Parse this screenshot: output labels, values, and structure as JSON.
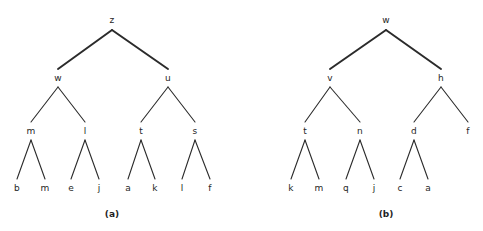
{
  "figure": {
    "background_color": "#ffffff",
    "edge_color": "#2b2b2b",
    "text_color": "#262626",
    "panels": [
      {
        "id": "a",
        "caption": "(a)",
        "caption_x": 112,
        "caption_y": 214,
        "nodes": [
          {
            "label": "z",
            "x": 112,
            "y": 20,
            "level": 0
          },
          {
            "label": "w",
            "x": 58,
            "y": 78,
            "level": 1
          },
          {
            "label": "u",
            "x": 168,
            "y": 78,
            "level": 1
          },
          {
            "label": "m",
            "x": 31,
            "y": 131,
            "level": 2
          },
          {
            "label": "l",
            "x": 85,
            "y": 131,
            "level": 2
          },
          {
            "label": "t",
            "x": 141,
            "y": 131,
            "level": 2
          },
          {
            "label": "s",
            "x": 195,
            "y": 131,
            "level": 2
          },
          {
            "label": "b",
            "x": 17,
            "y": 188,
            "level": 3
          },
          {
            "label": "m",
            "x": 45,
            "y": 188,
            "level": 3
          },
          {
            "label": "e",
            "x": 71,
            "y": 188,
            "level": 3
          },
          {
            "label": "j",
            "x": 99,
            "y": 188,
            "level": 3
          },
          {
            "label": "a",
            "x": 128,
            "y": 188,
            "level": 3
          },
          {
            "label": "k",
            "x": 155,
            "y": 188,
            "level": 3
          },
          {
            "label": "l",
            "x": 182,
            "y": 188,
            "level": 3
          },
          {
            "label": "f",
            "x": 210,
            "y": 188,
            "level": 3
          }
        ],
        "edges": [
          {
            "from": "z",
            "to": "w",
            "x1": 112,
            "y1": 30,
            "x2": 58,
            "y2": 69,
            "width": 2
          },
          {
            "from": "z",
            "to": "u",
            "x1": 112,
            "y1": 30,
            "x2": 168,
            "y2": 69,
            "width": 2
          },
          {
            "from": "w",
            "to": "m",
            "x1": 58,
            "y1": 87,
            "x2": 31,
            "y2": 122,
            "width": 1.1
          },
          {
            "from": "w",
            "to": "l",
            "x1": 58,
            "y1": 87,
            "x2": 85,
            "y2": 122,
            "width": 1.1
          },
          {
            "from": "u",
            "to": "t",
            "x1": 168,
            "y1": 87,
            "x2": 141,
            "y2": 122,
            "width": 1.1
          },
          {
            "from": "u",
            "to": "s",
            "x1": 168,
            "y1": 87,
            "x2": 195,
            "y2": 122,
            "width": 1.1
          },
          {
            "from": "m",
            "to": "b",
            "x1": 31,
            "y1": 140,
            "x2": 17,
            "y2": 179,
            "width": 1.1
          },
          {
            "from": "m",
            "to": "m2",
            "x1": 31,
            "y1": 140,
            "x2": 45,
            "y2": 179,
            "width": 1.1
          },
          {
            "from": "l",
            "to": "e",
            "x1": 85,
            "y1": 140,
            "x2": 71,
            "y2": 179,
            "width": 1.1
          },
          {
            "from": "l",
            "to": "j",
            "x1": 85,
            "y1": 140,
            "x2": 99,
            "y2": 179,
            "width": 1.1
          },
          {
            "from": "t",
            "to": "a",
            "x1": 141,
            "y1": 140,
            "x2": 128,
            "y2": 179,
            "width": 1.1
          },
          {
            "from": "t",
            "to": "k",
            "x1": 141,
            "y1": 140,
            "x2": 155,
            "y2": 179,
            "width": 1.1
          },
          {
            "from": "s",
            "to": "l2",
            "x1": 195,
            "y1": 140,
            "x2": 182,
            "y2": 179,
            "width": 1.1
          },
          {
            "from": "s",
            "to": "f",
            "x1": 195,
            "y1": 140,
            "x2": 210,
            "y2": 179,
            "width": 1.1
          }
        ]
      },
      {
        "id": "b",
        "caption": "(b)",
        "caption_x": 145,
        "caption_y": 214,
        "nodes": [
          {
            "label": "w",
            "x": 145,
            "y": 20,
            "level": 0
          },
          {
            "label": "v",
            "x": 89,
            "y": 78,
            "level": 1
          },
          {
            "label": "h",
            "x": 200,
            "y": 78,
            "level": 1
          },
          {
            "label": "t",
            "x": 64,
            "y": 131,
            "level": 2
          },
          {
            "label": "n",
            "x": 119,
            "y": 131,
            "level": 2
          },
          {
            "label": "d",
            "x": 173,
            "y": 131,
            "level": 2
          },
          {
            "label": "f",
            "x": 227,
            "y": 131,
            "level": 2
          },
          {
            "label": "k",
            "x": 50,
            "y": 188,
            "level": 3
          },
          {
            "label": "m",
            "x": 78,
            "y": 188,
            "level": 3
          },
          {
            "label": "q",
            "x": 105,
            "y": 188,
            "level": 3
          },
          {
            "label": "j",
            "x": 133,
            "y": 188,
            "level": 3
          },
          {
            "label": "c",
            "x": 159,
            "y": 188,
            "level": 3
          },
          {
            "label": "a",
            "x": 187,
            "y": 188,
            "level": 3
          }
        ],
        "edges": [
          {
            "from": "w",
            "to": "v",
            "x1": 145,
            "y1": 30,
            "x2": 89,
            "y2": 69,
            "width": 2
          },
          {
            "from": "w",
            "to": "h",
            "x1": 145,
            "y1": 30,
            "x2": 200,
            "y2": 69,
            "width": 2
          },
          {
            "from": "v",
            "to": "t",
            "x1": 89,
            "y1": 87,
            "x2": 64,
            "y2": 122,
            "width": 1.1
          },
          {
            "from": "v",
            "to": "n",
            "x1": 89,
            "y1": 87,
            "x2": 119,
            "y2": 122,
            "width": 1.1
          },
          {
            "from": "h",
            "to": "d",
            "x1": 200,
            "y1": 87,
            "x2": 173,
            "y2": 122,
            "width": 1.1
          },
          {
            "from": "h",
            "to": "f",
            "x1": 200,
            "y1": 87,
            "x2": 227,
            "y2": 122,
            "width": 1.1
          },
          {
            "from": "t",
            "to": "k",
            "x1": 64,
            "y1": 140,
            "x2": 50,
            "y2": 179,
            "width": 1.1
          },
          {
            "from": "t",
            "to": "m",
            "x1": 64,
            "y1": 140,
            "x2": 78,
            "y2": 179,
            "width": 1.1
          },
          {
            "from": "n",
            "to": "q",
            "x1": 119,
            "y1": 140,
            "x2": 105,
            "y2": 179,
            "width": 1.1
          },
          {
            "from": "n",
            "to": "j",
            "x1": 119,
            "y1": 140,
            "x2": 133,
            "y2": 179,
            "width": 1.1
          },
          {
            "from": "d",
            "to": "c",
            "x1": 173,
            "y1": 140,
            "x2": 159,
            "y2": 179,
            "width": 1.1
          },
          {
            "from": "d",
            "to": "a",
            "x1": 173,
            "y1": 140,
            "x2": 187,
            "y2": 179,
            "width": 1.1
          }
        ]
      }
    ]
  },
  "chart_data": {
    "type": "diagram",
    "subtype": "binary-tree",
    "title": "",
    "trees": [
      {
        "name": "(a)",
        "root": "z",
        "depth": 4,
        "node_labels": [
          "z",
          "w",
          "u",
          "m",
          "l",
          "t",
          "s",
          "b",
          "m",
          "e",
          "j",
          "a",
          "k",
          "l",
          "f"
        ],
        "leaf_labels": [
          "b",
          "m",
          "e",
          "j",
          "a",
          "k",
          "l",
          "f"
        ],
        "structure": {
          "z": [
            "w",
            "u"
          ],
          "w": [
            "m",
            "l"
          ],
          "u": [
            "t",
            "s"
          ],
          "m": [
            "b",
            "m"
          ],
          "l": [
            "e",
            "j"
          ],
          "t": [
            "a",
            "k"
          ],
          "s": [
            "l",
            "f"
          ]
        }
      },
      {
        "name": "(b)",
        "root": "w",
        "depth": 4,
        "node_labels": [
          "w",
          "v",
          "h",
          "t",
          "n",
          "d",
          "f",
          "k",
          "m",
          "q",
          "j",
          "c",
          "a"
        ],
        "leaf_labels": [
          "k",
          "m",
          "q",
          "j",
          "c",
          "a"
        ],
        "structure": {
          "w": [
            "v",
            "h"
          ],
          "v": [
            "t",
            "n"
          ],
          "h": [
            "d",
            "f"
          ],
          "t": [
            "k",
            "m"
          ],
          "n": [
            "q",
            "j"
          ],
          "d": [
            "c",
            "a"
          ],
          "f": []
        }
      }
    ]
  }
}
